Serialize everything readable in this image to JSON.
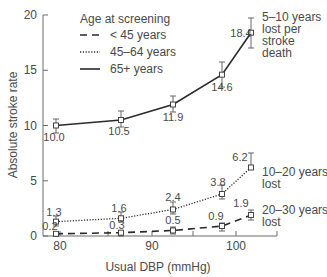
{
  "chart_data": {
    "type": "line",
    "title": "",
    "xlabel": "Usual DBP (mmHg)",
    "ylabel": "Absolute stroke rate",
    "xlim": [
      78,
      106
    ],
    "ylim": [
      0,
      20
    ],
    "x_ticks": [
      80,
      85,
      90,
      95,
      100,
      105
    ],
    "x_tick_labels": [
      "80",
      "",
      "90",
      "",
      "100",
      ""
    ],
    "y_ticks": [
      0,
      5,
      10,
      15,
      20
    ],
    "y_tick_labels": [
      "0",
      "5",
      "10",
      "15",
      "20"
    ],
    "grid": false,
    "legend": {
      "position": "upper-left",
      "title": "Age at screening",
      "entries": [
        {
          "label": "< 45 years",
          "style": "dashed"
        },
        {
          "label": "45–64 years",
          "style": "dotted"
        },
        {
          "label": "65+ years",
          "style": "solid"
        }
      ]
    },
    "x": [
      79.5,
      86.5,
      92.3,
      97.8,
      101.5
    ],
    "series": [
      {
        "name": "65+ years",
        "style": "solid",
        "values": [
          10.0,
          10.5,
          11.9,
          14.6,
          18.4
        ],
        "value_labels": [
          "10.0",
          "10.5",
          "11.9",
          "14.6",
          "18.4"
        ],
        "annotation": "5–10 years lost per stroke death"
      },
      {
        "name": "45–64 years",
        "style": "dotted",
        "values": [
          1.3,
          1.6,
          2.4,
          3.8,
          6.2
        ],
        "value_labels": [
          "1.3",
          "1.6",
          "2.4",
          "3.8",
          "6.2"
        ],
        "annotation": "10–20 years lost"
      },
      {
        "name": "< 45 years",
        "style": "dashed",
        "values": [
          0.2,
          0.3,
          0.5,
          0.9,
          1.9
        ],
        "value_labels": [
          "0.2",
          "0.3",
          "0.5",
          "0.9",
          "1.9"
        ],
        "annotation": "20–30 years lost"
      }
    ],
    "annotations": [
      {
        "series": "65+ years",
        "lines": [
          "5–10 years",
          "lost per",
          "stroke",
          "death"
        ]
      },
      {
        "series": "45–64 years",
        "lines": [
          "10–20 years",
          "lost"
        ]
      },
      {
        "series": "< 45 years",
        "lines": [
          "20–30 years",
          "lost"
        ]
      }
    ]
  },
  "render": {
    "plot": {
      "x0": 43,
      "x1": 277,
      "y0": 236,
      "ytop": 15
    },
    "x_tick_px": [
      60,
      108,
      152,
      193,
      236,
      277
    ],
    "point_x_px": [
      56,
      121,
      173,
      222,
      251
    ],
    "y_px_per_unit": 11.05,
    "series_err_px": [
      [
        [
          119,
          133
        ],
        [
          111,
          127
        ],
        [
          96,
          112
        ],
        [
          62,
          87
        ],
        [
          18,
          48
        ]
      ],
      [
        [
          216,
          226
        ],
        [
          212,
          222
        ],
        [
          202,
          214
        ],
        [
          185,
          199
        ],
        [
          153,
          167
        ]
      ],
      [
        [
          233,
          236
        ],
        [
          231,
          236
        ],
        [
          227,
          234
        ],
        [
          223,
          231
        ],
        [
          210,
          220
        ]
      ]
    ],
    "label_offsets": [
      [
        [
          -2,
          15
        ],
        [
          -2,
          15
        ],
        [
          0,
          16
        ],
        [
          0,
          16
        ],
        [
          -10,
          4
        ]
      ],
      [
        [
          -2,
          -6
        ],
        [
          -2,
          -6
        ],
        [
          0,
          -8
        ],
        [
          -4,
          -8
        ],
        [
          -11,
          -6
        ]
      ],
      [
        [
          -6,
          -4
        ],
        [
          -4,
          -4
        ],
        [
          0,
          -6
        ],
        [
          -6,
          -6
        ],
        [
          -10,
          -8
        ]
      ]
    ],
    "annotation_pos": [
      [
        262,
        21
      ],
      [
        262,
        176
      ],
      [
        262,
        214
      ]
    ]
  }
}
